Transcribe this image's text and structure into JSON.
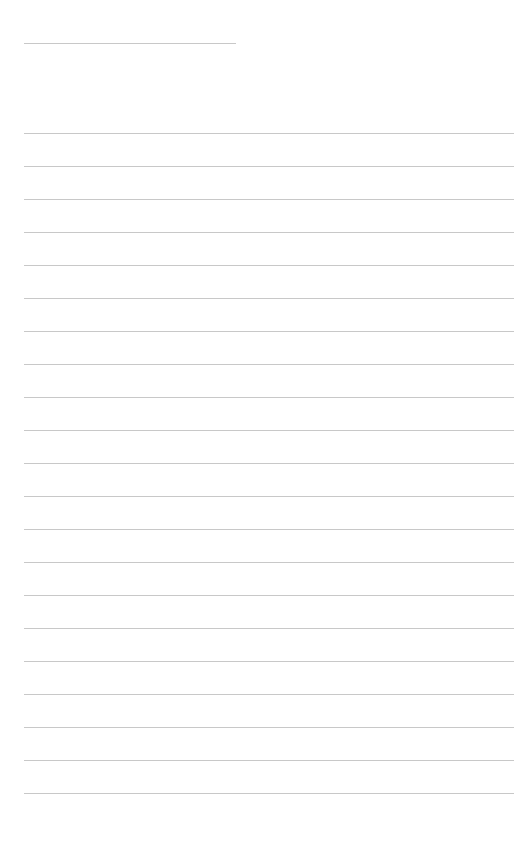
{
  "page": {
    "type": "lined-paper",
    "background_color": "#ffffff",
    "line_color": "#c8c8c8",
    "title_line": {
      "x": 24,
      "y": 43,
      "width": 212
    },
    "ruled_lines": {
      "count": 21,
      "start_y": 133,
      "spacing": 33,
      "x": 24,
      "width": 490
    },
    "text_content": []
  }
}
